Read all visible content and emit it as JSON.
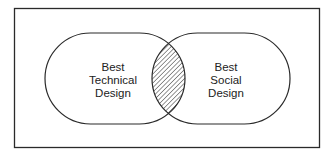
{
  "diagram": {
    "type": "venn",
    "sets": [
      {
        "name": "left-set",
        "lines": [
          "Best",
          "Technical",
          "Design"
        ]
      },
      {
        "name": "right-set",
        "lines": [
          "Best",
          "Social",
          "Design"
        ]
      }
    ],
    "intersection": {
      "fill": "hatched"
    },
    "colors": {
      "stroke": "#2a2a2a",
      "background": "#ffffff"
    }
  }
}
